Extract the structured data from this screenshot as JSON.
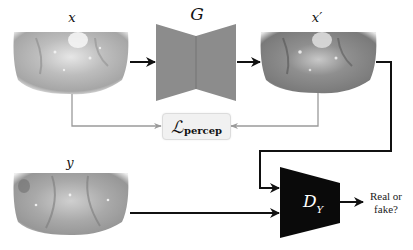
{
  "diagram": {
    "type": "GAN training pipeline with perceptual loss",
    "nodes": {
      "input_x": {
        "label": "x",
        "kind": "image",
        "description": "endoscopic tissue image (input)"
      },
      "generator": {
        "label": "G",
        "kind": "encoder-decoder block",
        "color": "#8c8c8c"
      },
      "output_x_prime": {
        "label": "x′",
        "kind": "image",
        "description": "generated tissue image"
      },
      "loss": {
        "main": "ℒ",
        "subscript": "percep",
        "kind": "loss box",
        "fill": "#f1f1f1"
      },
      "target_y": {
        "label": "y",
        "kind": "image",
        "description": "real target tissue image"
      },
      "discriminator": {
        "main": "D",
        "subscript": "Y",
        "kind": "discriminator block",
        "color": "#0a0a0a"
      },
      "output": {
        "line1": "Real or",
        "line2": "fake?"
      }
    },
    "edges": [
      {
        "from": "input_x",
        "to": "generator",
        "style": "black-arrow"
      },
      {
        "from": "generator",
        "to": "output_x_prime",
        "style": "black-arrow"
      },
      {
        "from": "input_x",
        "to": "loss",
        "style": "gray-arrow"
      },
      {
        "from": "output_x_prime",
        "to": "loss",
        "style": "gray-arrow"
      },
      {
        "from": "output_x_prime",
        "to": "discriminator",
        "style": "black-arrow"
      },
      {
        "from": "target_y",
        "to": "discriminator",
        "style": "black-arrow"
      },
      {
        "from": "discriminator",
        "to": "output",
        "style": "black-arrow"
      }
    ],
    "colors": {
      "black_edge": "#111111",
      "gray_edge": "#9a9a9a",
      "generator_fill": "#8c8c8c",
      "discriminator_fill": "#0a0a0a"
    }
  }
}
